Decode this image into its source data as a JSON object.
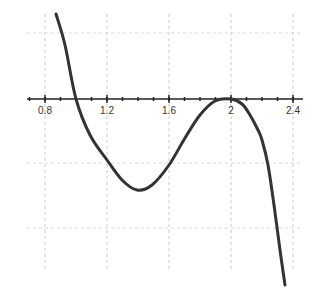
{
  "chart_data": {
    "type": "line",
    "title": "",
    "xlabel": "",
    "ylabel": "",
    "xlim": [
      0.7,
      2.45
    ],
    "x_ticks": [
      0.8,
      1.2,
      1.6,
      2,
      2.4
    ],
    "x_tick_labels": [
      "0.8",
      "1.2",
      "1.6",
      "2",
      "2.4"
    ],
    "grid": true,
    "series": [
      {
        "name": "f(x)",
        "color": "#333333",
        "points_px": [
          [
            56,
            14
          ],
          [
            65,
            45
          ],
          [
            76,
            99
          ],
          [
            90,
            135
          ],
          [
            107,
            160
          ],
          [
            122,
            180
          ],
          [
            137,
            190
          ],
          [
            152,
            185
          ],
          [
            169,
            165
          ],
          [
            185,
            138
          ],
          [
            200,
            115
          ],
          [
            215,
            101
          ],
          [
            231,
            99
          ],
          [
            242,
            104
          ],
          [
            250,
            115
          ],
          [
            258,
            130
          ],
          [
            262,
            140
          ],
          [
            268,
            165
          ],
          [
            274,
            205
          ],
          [
            280,
            250
          ],
          [
            285,
            285
          ]
        ],
        "x": [
          0.88,
          0.94,
          1.0,
          1.09,
          1.2,
          1.3,
          1.4,
          1.5,
          1.6,
          1.7,
          1.8,
          1.9,
          2.0,
          2.07,
          2.12,
          2.17,
          2.2,
          2.24,
          2.28,
          2.32,
          2.35
        ],
        "features": {
          "root": 1.0,
          "local_min_x": 1.4,
          "double_root_local_max": 2.0
        }
      }
    ]
  }
}
